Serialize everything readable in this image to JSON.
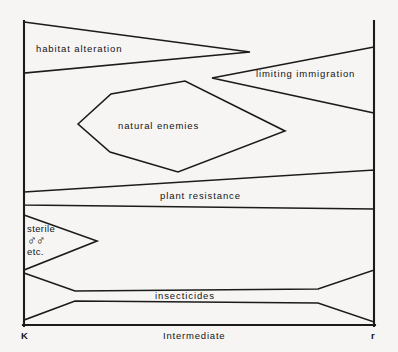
{
  "figure": {
    "background_color": "#f6f5f3",
    "line_color": "#1b1b1b"
  },
  "axis": {
    "left_label": "K",
    "center_label": "Intermediate",
    "right_label": "r",
    "left_x": 24,
    "right_x": 374,
    "baseline_y": 325,
    "top_y": 22
  },
  "regions": [
    {
      "id": "habitat-alteration",
      "label": "habitat alteration",
      "label_x": 36,
      "label_y": 43,
      "shape": "triangle-pointing-right",
      "points": "24,22 250,52 24,73"
    },
    {
      "id": "limiting-immigration",
      "label": "limiting immigration",
      "label_x": 256,
      "label_y": 68,
      "shape": "wedge-pointing-left",
      "points": "374,47 212,78 374,113"
    },
    {
      "id": "natural-enemies",
      "label": "natural enemies",
      "label_x": 118,
      "label_y": 120,
      "shape": "hexagon",
      "points": "78,124 111,94 185,81 285,131 178,172 110,152"
    },
    {
      "id": "plant-resistance",
      "label": "plant resistance",
      "label_x": 160,
      "label_y": 190,
      "shape": "tapered-band",
      "points": "24,192 374,170 374,209 24,205"
    },
    {
      "id": "sterile-males",
      "label": "sterile",
      "label_line2": "♂♂",
      "label_line3": "etc.",
      "label_x": 27,
      "label_y": 224,
      "shape": "triangle-pointing-right",
      "points": "24,215 97,241 24,270"
    },
    {
      "id": "insecticides",
      "label": "insecticides",
      "label_x": 155,
      "label_y": 290,
      "shape": "hourglass-bowtie",
      "points": "24,273 75,291 318,289 374,270 374,322 318,303 75,301 24,320"
    }
  ]
}
